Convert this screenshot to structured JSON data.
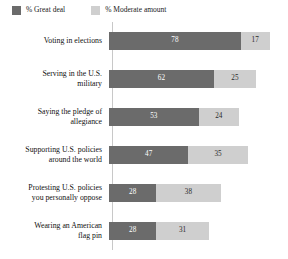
{
  "legend": {
    "items": [
      {
        "label": "% Great deal",
        "swatch": "dark",
        "color": "#6b6b6b"
      },
      {
        "label": "% Moderate amount",
        "swatch": "light",
        "color": "#cfcfcf"
      }
    ]
  },
  "chart_data": {
    "type": "bar",
    "orientation": "horizontal",
    "stacked": true,
    "title": "",
    "subtitle": "",
    "xlabel": "",
    "ylabel": "",
    "xlim": [
      0,
      100
    ],
    "grid": false,
    "legend_position": "top-left",
    "categories": [
      "Voting in elections",
      "Serving in the U.S. military",
      "Saying the pledge of allegiance",
      "Supporting U.S. policies around the world",
      "Protesting U.S. policies you personally oppose",
      "Wearing an American flag pin"
    ],
    "series": [
      {
        "name": "% Great deal",
        "color": "#6b6b6b",
        "values": [
          78,
          62,
          53,
          47,
          28,
          28
        ]
      },
      {
        "name": "% Moderate amount",
        "color": "#cfcfcf",
        "values": [
          17,
          25,
          24,
          35,
          38,
          31
        ]
      }
    ],
    "rows": [
      {
        "label_line1": "Voting in elections",
        "label_line2": "",
        "great_deal": 78,
        "moderate": 17,
        "great_deal_text": "78",
        "moderate_text": "17"
      },
      {
        "label_line1": "Serving in the U.S.",
        "label_line2": "military",
        "great_deal": 62,
        "moderate": 25,
        "great_deal_text": "62",
        "moderate_text": "25"
      },
      {
        "label_line1": "Saying the pledge of",
        "label_line2": "allegiance",
        "great_deal": 53,
        "moderate": 24,
        "great_deal_text": "53",
        "moderate_text": "24"
      },
      {
        "label_line1": "Supporting U.S. policies",
        "label_line2": "around the world",
        "great_deal": 47,
        "moderate": 35,
        "great_deal_text": "47",
        "moderate_text": "35"
      },
      {
        "label_line1": "Protesting U.S. policies",
        "label_line2": "you personally oppose",
        "great_deal": 28,
        "moderate": 38,
        "great_deal_text": "28",
        "moderate_text": "38"
      },
      {
        "label_line1": "Wearing an American",
        "label_line2": "flag pin",
        "great_deal": 28,
        "moderate": 31,
        "great_deal_text": "28",
        "moderate_text": "31"
      }
    ]
  }
}
